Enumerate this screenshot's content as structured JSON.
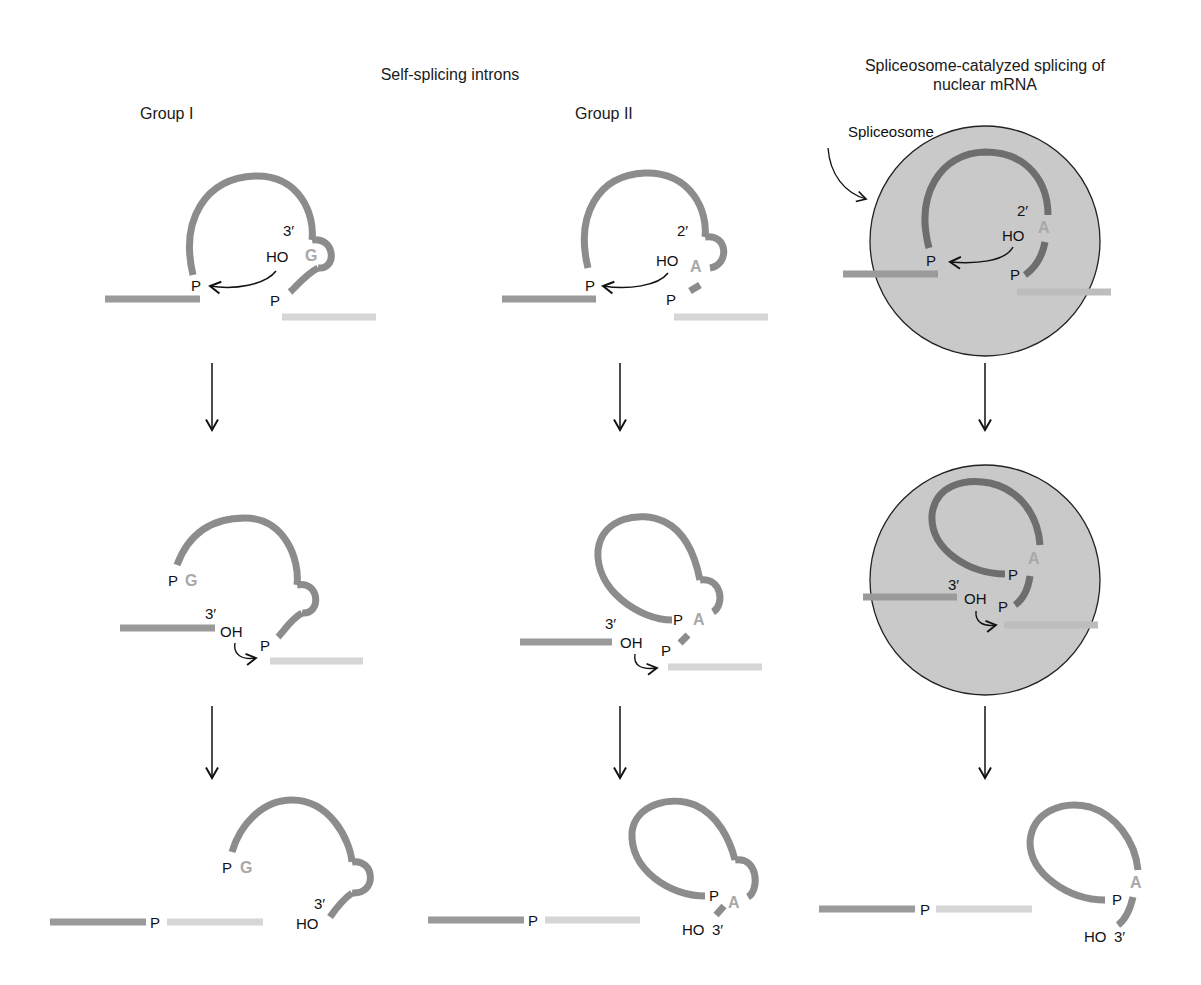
{
  "headings": {
    "self_splicing": "Self-splicing introns",
    "spliceosome": "Spliceosome-catalyzed splicing of nuclear mRNA",
    "group1": "Group I",
    "group2": "Group II"
  },
  "callouts": {
    "spliceosome_label": "Spliceosome"
  },
  "labels": {
    "P": "P",
    "G": "G",
    "A": "A",
    "HO": "HO",
    "OH": "OH",
    "three_prime": "3′",
    "two_prime": "2′"
  },
  "colors": {
    "intron": "#8c8c8c",
    "intron_spliceosome": "#6e6e6e",
    "exon1": "#9a9a9a",
    "exon2": "#d6d6d6",
    "base_letter": "#a8a8a8",
    "spliceosome_fill": "#c9c9c9",
    "text": "#111111"
  },
  "stages": [
    "Step 1: nucleophilic attack",
    "Step 2: exon ligation",
    "Products: joined exons + excised intron"
  ]
}
